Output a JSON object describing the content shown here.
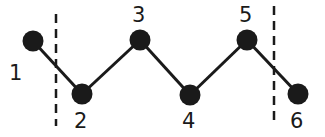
{
  "diagram": {
    "type": "zigzag-chain",
    "colors": {
      "stroke": "#1a1a1a",
      "node": "#1a1a1a",
      "background": "#ffffff"
    },
    "nodes": [
      {
        "id": "1",
        "label": "1",
        "x": 33,
        "y": 41,
        "lx": 9,
        "ly": 80
      },
      {
        "id": "2",
        "label": "2",
        "x": 82,
        "y": 94,
        "lx": 74,
        "ly": 128
      },
      {
        "id": "3",
        "label": "3",
        "x": 140,
        "y": 40,
        "lx": 132,
        "ly": 22
      },
      {
        "id": "4",
        "label": "4",
        "x": 190,
        "y": 95,
        "lx": 182,
        "ly": 128
      },
      {
        "id": "5",
        "label": "5",
        "x": 247,
        "y": 40,
        "lx": 239,
        "ly": 22
      },
      {
        "id": "6",
        "label": "6",
        "x": 298,
        "y": 94,
        "lx": 290,
        "ly": 128
      }
    ],
    "edges": [
      [
        "1",
        "2"
      ],
      [
        "2",
        "3"
      ],
      [
        "3",
        "4"
      ],
      [
        "4",
        "5"
      ],
      [
        "5",
        "6"
      ]
    ],
    "dashed_boundaries": [
      {
        "x": 56,
        "y1": 14,
        "y2": 126
      },
      {
        "x": 274,
        "y1": 6,
        "y2": 126
      }
    ]
  }
}
